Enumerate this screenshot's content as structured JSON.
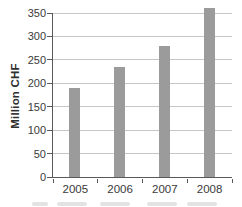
{
  "chart_data": {
    "type": "bar",
    "title": "",
    "xlabel": "",
    "ylabel": "Million CHF",
    "categories": [
      "2005",
      "2006",
      "2007",
      "2008"
    ],
    "values": [
      190,
      235,
      280,
      360
    ],
    "ylim": [
      0,
      350
    ],
    "ytick_interval": 50,
    "yticks": [
      0,
      50,
      100,
      150,
      200,
      250,
      300,
      350
    ],
    "grid": "horizontal",
    "legend": "none",
    "bar_overflows_plot_top": true
  },
  "colors": {
    "background": "#ffffff",
    "bar": "#9b9b9b",
    "grid": "#c6c6c6",
    "axis": "#595959",
    "text": "#3a3a3a",
    "caption_fragment": "#b9b9b9"
  }
}
